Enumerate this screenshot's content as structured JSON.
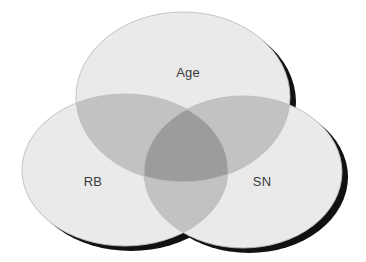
{
  "diagram": {
    "type": "venn",
    "title": "",
    "set_count": 3,
    "background_color": "#ffffff",
    "sets": [
      {
        "id": "age",
        "label": "Age",
        "position": "top-center",
        "label_x": 188,
        "label_y": 74,
        "ellipse": {
          "cx": 183,
          "cy": 97,
          "rx": 107,
          "ry": 85
        },
        "fill_color": "#eaeaea",
        "shadow_color": "#111111"
      },
      {
        "id": "rb",
        "label": "RB",
        "position": "bottom-left",
        "label_x": 93,
        "label_y": 183,
        "ellipse": {
          "cx": 125,
          "cy": 170,
          "rx": 103,
          "ry": 76
        },
        "fill_color": "#eaeaea",
        "shadow_color": "#111111"
      },
      {
        "id": "sn",
        "label": "SN",
        "position": "bottom-right",
        "label_x": 262,
        "label_y": 183,
        "ellipse": {
          "cx": 243,
          "cy": 172,
          "rx": 99,
          "ry": 76
        },
        "fill_color": "#eaeaea",
        "shadow_color": "#111111"
      }
    ],
    "regions": [
      {
        "id": "age-only",
        "sets": [
          "Age"
        ],
        "fill_color": "#eaeaea"
      },
      {
        "id": "rb-only",
        "sets": [
          "RB"
        ],
        "fill_color": "#eaeaea"
      },
      {
        "id": "sn-only",
        "sets": [
          "SN"
        ],
        "fill_color": "#eaeaea"
      },
      {
        "id": "age-rb",
        "sets": [
          "Age",
          "RB"
        ],
        "fill_color": "#c2c2c2"
      },
      {
        "id": "age-sn",
        "sets": [
          "Age",
          "SN"
        ],
        "fill_color": "#c2c2c2"
      },
      {
        "id": "rb-sn",
        "sets": [
          "RB",
          "SN"
        ],
        "fill_color": "#c2c2c2"
      },
      {
        "id": "age-rb-sn",
        "sets": [
          "Age",
          "RB",
          "SN"
        ],
        "fill_color": "#9c9c9c"
      }
    ],
    "label_color": "#3a3a3a",
    "label_font_size": 13
  }
}
